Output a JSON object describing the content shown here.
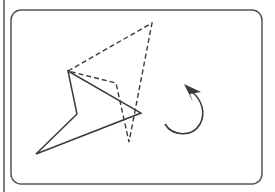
{
  "diagram": {
    "type": "rotation-transformation",
    "colors": {
      "stroke": "#3a3a3a",
      "frame": "#555555",
      "background": "#ffffff"
    },
    "frame": {
      "x": 11,
      "y": 10,
      "width": 251,
      "height": 174,
      "radius": 10
    },
    "left_edge_line": {
      "x": 4,
      "y1": 0,
      "y2": 192
    },
    "original_shape": {
      "style": "solid",
      "points": [
        [
          68,
          71
        ],
        [
          77,
          114
        ],
        [
          36,
          154
        ],
        [
          141,
          113
        ]
      ]
    },
    "rotated_shape": {
      "style": "dashed",
      "points": [
        [
          68,
          71
        ],
        [
          152,
          23
        ],
        [
          129,
          142
        ],
        [
          116,
          83
        ]
      ]
    },
    "rotation_arrow": {
      "direction": "counterclockwise",
      "start": [
        165,
        124
      ],
      "tip": [
        184,
        84
      ]
    }
  }
}
